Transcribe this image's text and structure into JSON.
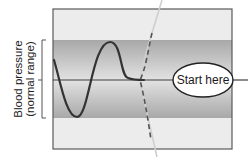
{
  "diagram": {
    "axis_label": {
      "line1": "Blood pressure",
      "line2": "(normal range)"
    },
    "start_label": "Start here",
    "colors": {
      "background": "#ffffff",
      "outer_band": "#ebebeb",
      "inner_band_edge": "#a9a9a9",
      "inner_band_center": "#d6d6d6",
      "frame": "#555555",
      "wave": "#333333",
      "midline": "#444444",
      "dashed_path": "#555555",
      "streak": "#c8c8c8",
      "ellipse_fill": "#ffffff",
      "ellipse_stroke": "#222222"
    },
    "elements": [
      {
        "name": "normal-range-band",
        "description": "darker horizontal band indicating normal blood pressure range"
      },
      {
        "name": "set-point-line",
        "description": "horizontal midline at the set point"
      },
      {
        "name": "oscillating-wave",
        "description": "blood pressure fluctuating above and below the set point before settling"
      },
      {
        "name": "dashed-transition-path",
        "description": "dashed curve indicating a deviation path"
      },
      {
        "name": "start-ellipse",
        "description": "oval labeled Start here at the right end of the midline"
      }
    ]
  }
}
